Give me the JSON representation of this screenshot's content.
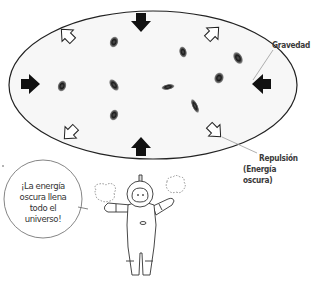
{
  "top_fragment": "el universo.",
  "labels": {
    "gravity": "Gravedad",
    "repulsion_line1": "Repulsión",
    "repulsion_line2": "(Energía oscura)"
  },
  "speech_bubble": {
    "line1": "¡La energía",
    "line2": "oscura llena",
    "line3": "todo el",
    "line4": "universo!"
  },
  "colors": {
    "outline": "#222222",
    "fill": "#f7f7f7",
    "arrow_solid": "#111111",
    "leader_line": "#9a9a9a"
  },
  "icons": {
    "inward_arrows": "gravity-arrow-icon",
    "outward_arrows": "repulsion-arrow-icon",
    "galaxies": "galaxy-icon",
    "astronaut": "astronaut-icon"
  }
}
